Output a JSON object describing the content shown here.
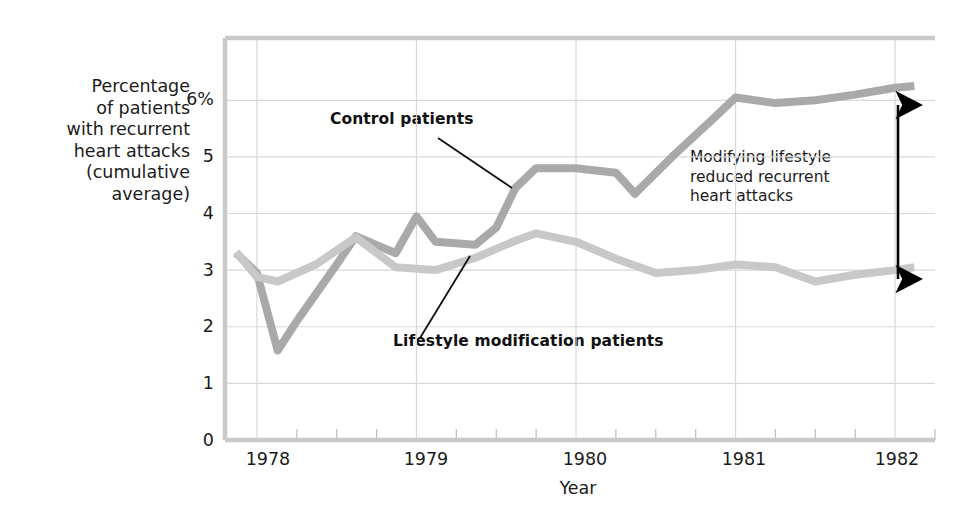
{
  "chart_data": {
    "type": "line",
    "title": "",
    "xlabel": "Year",
    "ylabel": "Percentage of patients with recurrent heart attacks (cumulative average)",
    "ylabel_lines": [
      "Percentage",
      "of patients",
      "with recurrent",
      "heart attacks",
      "(cumulative",
      "average)"
    ],
    "xlim": [
      1977.8,
      1982.25
    ],
    "ylim": [
      0,
      7.1
    ],
    "grid": true,
    "legend": "none",
    "y_ticks": [
      {
        "value": 0,
        "label": "0"
      },
      {
        "value": 1,
        "label": "1"
      },
      {
        "value": 2,
        "label": "2"
      },
      {
        "value": 3,
        "label": "3"
      },
      {
        "value": 4,
        "label": "4"
      },
      {
        "value": 5,
        "label": "5"
      },
      {
        "value": 6,
        "label": "6%"
      }
    ],
    "x_ticks": [
      {
        "value": 1978,
        "label": "1978"
      },
      {
        "value": 1979,
        "label": "1979"
      },
      {
        "value": 1980,
        "label": "1980"
      },
      {
        "value": 1981,
        "label": "1981"
      },
      {
        "value": 1982,
        "label": "1982"
      }
    ],
    "x_minor_tick_interval": 0.25,
    "series": [
      {
        "name": "Control patients",
        "color": "#a9a9a9",
        "x": [
          1977.87,
          1978.0,
          1978.13,
          1978.25,
          1978.5,
          1978.62,
          1978.87,
          1979.0,
          1979.12,
          1979.37,
          1979.5,
          1979.62,
          1979.75,
          1980.0,
          1980.25,
          1980.37,
          1980.62,
          1980.87,
          1981.0,
          1981.25,
          1981.5,
          1981.75,
          1982.0,
          1982.12
        ],
        "values": [
          3.3,
          2.95,
          1.58,
          2.1,
          3.1,
          3.6,
          3.3,
          3.95,
          3.5,
          3.45,
          3.75,
          4.45,
          4.8,
          4.8,
          4.72,
          4.35,
          5.05,
          5.7,
          6.05,
          5.95,
          6.0,
          6.1,
          6.22,
          6.25
        ]
      },
      {
        "name": "Lifestyle modification patients",
        "color": "#c8c8c8",
        "x": [
          1977.87,
          1978.0,
          1978.13,
          1978.37,
          1978.62,
          1978.87,
          1979.12,
          1979.37,
          1979.62,
          1979.75,
          1980.0,
          1980.25,
          1980.5,
          1980.75,
          1981.0,
          1981.25,
          1981.5,
          1981.75,
          1982.0,
          1982.12
        ],
        "values": [
          3.32,
          2.88,
          2.8,
          3.1,
          3.58,
          3.05,
          3.0,
          3.22,
          3.52,
          3.65,
          3.5,
          3.2,
          2.95,
          3.0,
          3.1,
          3.05,
          2.8,
          2.92,
          3.0,
          3.05
        ]
      }
    ],
    "annotations": [
      {
        "name": "control-callout",
        "text": "Control patients",
        "label_x": 330,
        "label_y": 118,
        "leader": {
          "x1": 438,
          "y1": 138,
          "x2": 512,
          "y2": 188
        }
      },
      {
        "name": "lifestyle-callout",
        "text": "Lifestyle modification patients",
        "label_x": 393,
        "label_y": 340,
        "leader": {
          "x1": 420,
          "y1": 338,
          "x2": 470,
          "y2": 256
        }
      },
      {
        "name": "gap-annotation",
        "lines": [
          "Modifying lifestyle",
          "reduced recurrent",
          "heart attacks"
        ],
        "arrow": {
          "x": 898,
          "y_top": 102,
          "y_bottom": 282
        }
      }
    ]
  },
  "axis_colors": {
    "grid": "#d8d8d8",
    "axis": "#c9c9c9",
    "text": "#1b1b1b",
    "arrow": "#000000"
  }
}
